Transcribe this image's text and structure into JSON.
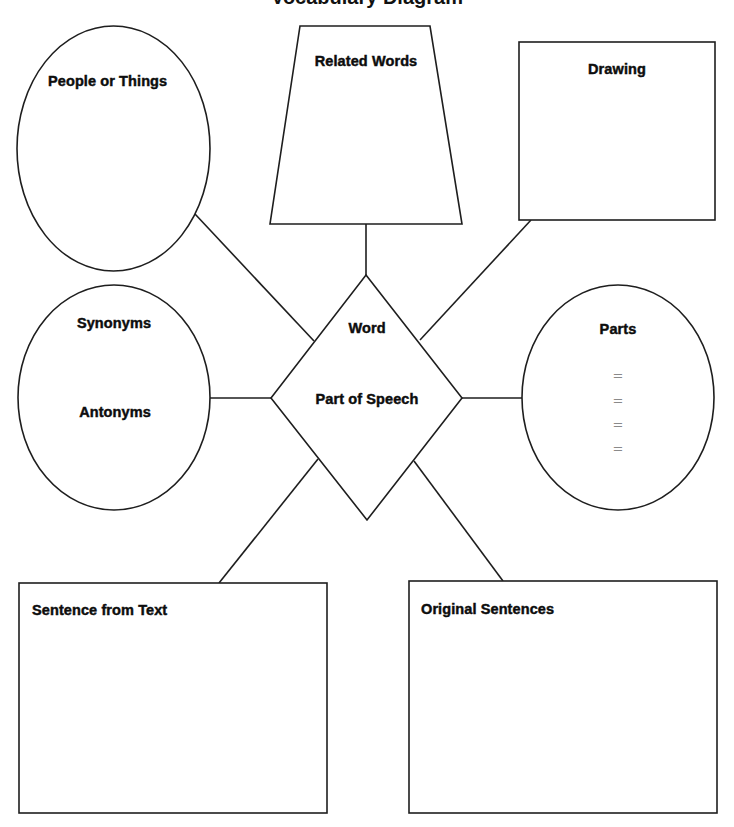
{
  "diagram": {
    "title_partial": "Vocabulary Diagram",
    "center": {
      "shape": "diamond",
      "word_label": "Word",
      "pos_label": "Part of Speech"
    },
    "nodes": [
      {
        "id": "people",
        "shape": "ellipse",
        "label": "People or Things"
      },
      {
        "id": "related",
        "shape": "trapezoid",
        "label": "Related Words"
      },
      {
        "id": "drawing",
        "shape": "rectangle",
        "label": "Drawing"
      },
      {
        "id": "synant",
        "shape": "ellipse",
        "label": "Synonyms",
        "label2": "Antonyms"
      },
      {
        "id": "parts",
        "shape": "ellipse",
        "label": "Parts",
        "entries": [
          "=",
          "=",
          "=",
          "="
        ]
      },
      {
        "id": "sentence",
        "shape": "rectangle",
        "label": "Sentence from Text"
      },
      {
        "id": "original",
        "shape": "rectangle",
        "label": "Original Sentences"
      }
    ],
    "colors": {
      "stroke": "#1e1e1e",
      "text": "#0d0d0d",
      "placeholder": "#8a8a8a",
      "background": "#ffffff"
    }
  }
}
